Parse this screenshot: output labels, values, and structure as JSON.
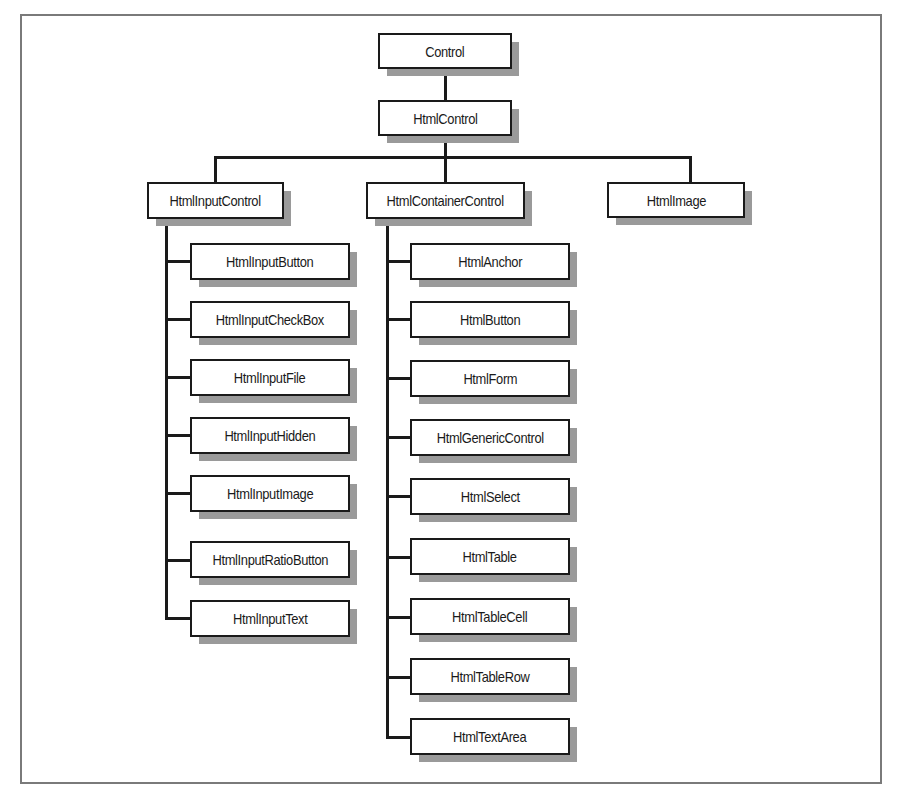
{
  "diagram": {
    "type": "class-hierarchy",
    "root": {
      "label": "Control"
    },
    "level1": {
      "label": "HtmlControl"
    },
    "level2": [
      {
        "label": "HtmlInputControl"
      },
      {
        "label": "HtmlContainerControl"
      },
      {
        "label": "HtmlImage"
      }
    ],
    "input_children": [
      {
        "label": "HtmlInputButton"
      },
      {
        "label": "HtmlInputCheckBox"
      },
      {
        "label": "HtmlInputFile"
      },
      {
        "label": "HtmlInputHidden"
      },
      {
        "label": "HtmlInputImage"
      },
      {
        "label": "HtmlInputRatioButton"
      },
      {
        "label": "HtmlInputText"
      }
    ],
    "container_children": [
      {
        "label": "HtmlAnchor"
      },
      {
        "label": "HtmlButton"
      },
      {
        "label": "HtmlForm"
      },
      {
        "label": "HtmlGenericControl"
      },
      {
        "label": "HtmlSelect"
      },
      {
        "label": "HtmlTable"
      },
      {
        "label": "HtmlTableCell"
      },
      {
        "label": "HtmlTableRow"
      },
      {
        "label": "HtmlTextArea"
      }
    ],
    "colors": {
      "border": "#1a1a1a",
      "shadow": "#9a9a9a",
      "frame": "#7a7a7a",
      "background": "#ffffff"
    }
  }
}
